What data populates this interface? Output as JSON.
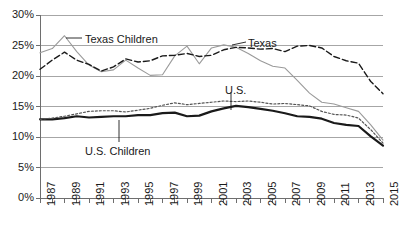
{
  "chart_data": {
    "type": "line",
    "title": "",
    "xlabel": "",
    "ylabel": "",
    "ylim": [
      0,
      30
    ],
    "yticks": [
      "0%",
      "5%",
      "10%",
      "15%",
      "20%",
      "25%",
      "30%"
    ],
    "ytick_values": [
      0,
      5,
      10,
      15,
      20,
      25,
      30
    ],
    "grid": true,
    "legend_position": "inline-annotations",
    "x": [
      1987,
      1988,
      1989,
      1990,
      1991,
      1992,
      1993,
      1994,
      1995,
      1996,
      1997,
      1998,
      1999,
      2000,
      2001,
      2002,
      2003,
      2004,
      2005,
      2006,
      2007,
      2008,
      2009,
      2010,
      2011,
      2012,
      2013,
      2014,
      2015
    ],
    "xticks": [
      "1987",
      "1989",
      "1991",
      "1993",
      "1995",
      "1997",
      "1999",
      "2001",
      "2003",
      "2005",
      "2007",
      "2009",
      "2011",
      "2013",
      "2015"
    ],
    "xtick_values": [
      1987,
      1989,
      1991,
      1993,
      1995,
      1997,
      1999,
      2001,
      2003,
      2005,
      2007,
      2009,
      2011,
      2013,
      2015
    ],
    "series": [
      {
        "name": "Texas Children",
        "style": "solid-thin-gray",
        "color": "#9a9a9a",
        "values": [
          23.8,
          24.5,
          26.6,
          24.0,
          21.8,
          20.7,
          21.0,
          22.6,
          21.3,
          20.1,
          20.2,
          23.3,
          24.9,
          22.0,
          24.6,
          25.1,
          24.7,
          23.7,
          22.5,
          21.6,
          21.3,
          19.3,
          17.2,
          15.7,
          15.4,
          14.8,
          14.2,
          12.0,
          9.5
        ]
      },
      {
        "name": "Texas",
        "style": "dashed-black",
        "color": "#1a1a1a",
        "values": [
          21.1,
          22.6,
          23.9,
          22.6,
          21.9,
          20.8,
          21.5,
          22.8,
          22.3,
          22.5,
          23.3,
          23.4,
          23.7,
          23.2,
          23.4,
          24.3,
          24.7,
          24.6,
          24.4,
          24.5,
          24.0,
          24.9,
          25.0,
          24.6,
          23.2,
          22.5,
          22.1,
          19.1,
          17.1
        ]
      },
      {
        "name": "U.S.",
        "style": "solid-thick-black",
        "color": "#1a1a1a",
        "values": [
          12.9,
          12.9,
          13.1,
          13.4,
          13.2,
          13.3,
          13.4,
          13.4,
          13.6,
          13.6,
          13.9,
          14.0,
          13.4,
          13.5,
          14.2,
          14.7,
          15.1,
          14.9,
          14.6,
          14.3,
          13.9,
          13.4,
          13.3,
          13.0,
          12.3,
          12.0,
          11.8,
          10.1,
          8.6
        ]
      },
      {
        "name": "U.S. Children",
        "style": "dotted-gray",
        "color": "#555555",
        "values": [
          12.9,
          13.1,
          13.4,
          13.8,
          14.2,
          14.3,
          14.3,
          14.1,
          14.4,
          14.7,
          15.2,
          15.6,
          15.3,
          15.5,
          15.7,
          15.9,
          15.8,
          15.9,
          15.7,
          15.4,
          15.5,
          15.3,
          15.1,
          14.2,
          13.7,
          13.6,
          13.1,
          11.2,
          9.0
        ]
      }
    ],
    "annotations": [
      {
        "label": "Texas Children",
        "x_px": 85,
        "y_px": 33
      },
      {
        "label": "Texas",
        "x_px": 248,
        "y_px": 37
      },
      {
        "label": "U.S.",
        "x_px": 225,
        "y_px": 84
      },
      {
        "label": "U.S. Children",
        "x_px": 85,
        "y_px": 145
      }
    ]
  },
  "colors": {
    "grid": "#a6a6a6",
    "axis": "#6e6e6e",
    "text": "#1a1a1a",
    "texas_children": "#9a9a9a",
    "texas": "#1a1a1a",
    "us": "#1a1a1a",
    "us_children": "#555555",
    "background": "#ffffff"
  }
}
